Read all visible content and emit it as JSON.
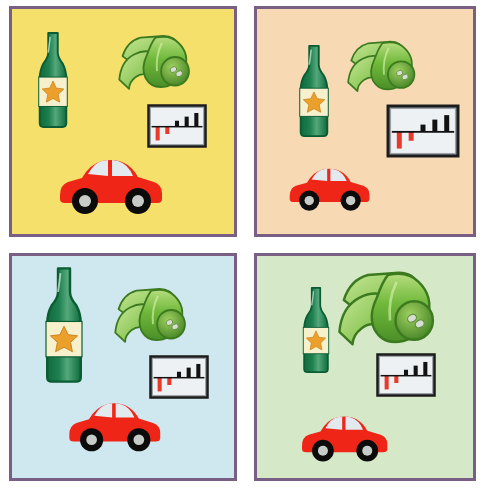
{
  "image": {
    "title": "Four clipart scenes grid",
    "layout": "2x2 grid of bordered panels",
    "border_color": "#7a5f85",
    "page_background": "#ffffff"
  },
  "panels": [
    {
      "id": "panel-top-left",
      "position": "top-left",
      "background_color": "#f5e06b",
      "objects": [
        {
          "name": "bottle-with-star-label",
          "label": "Bottle",
          "size": "medium",
          "x": 22,
          "y": 22,
          "w": 38,
          "h": 98
        },
        {
          "name": "rolled-carpet",
          "label": "Rolled carpet",
          "size": "medium",
          "x": 104,
          "y": 22,
          "w": 82,
          "h": 62
        },
        {
          "name": "bar-chart-picture",
          "label": "Bar chart picture",
          "size": "small",
          "x": 134,
          "y": 94,
          "w": 62,
          "h": 46
        },
        {
          "name": "red-car",
          "label": "Red car",
          "size": "large",
          "x": 42,
          "y": 136,
          "w": 110,
          "h": 72
        }
      ]
    },
    {
      "id": "panel-top-right",
      "position": "top-right",
      "background_color": "#f7d9b4",
      "objects": [
        {
          "name": "bottle-with-star-label",
          "label": "Bottle",
          "size": "medium",
          "x": 38,
          "y": 35,
          "w": 38,
          "h": 94
        },
        {
          "name": "rolled-carpet",
          "label": "Rolled carpet",
          "size": "medium",
          "x": 88,
          "y": 28,
          "w": 78,
          "h": 58
        },
        {
          "name": "bar-chart-picture",
          "label": "Bar chart picture",
          "size": "large",
          "x": 128,
          "y": 94,
          "w": 76,
          "h": 56
        },
        {
          "name": "red-car",
          "label": "Red car",
          "size": "small",
          "x": 28,
          "y": 148,
          "w": 86,
          "h": 56
        }
      ]
    },
    {
      "id": "panel-bottom-left",
      "position": "bottom-left",
      "background_color": "#cfe7ee",
      "objects": [
        {
          "name": "bottle-with-star-label",
          "label": "Bottle",
          "size": "large",
          "x": 28,
          "y": 10,
          "w": 48,
          "h": 118
        },
        {
          "name": "rolled-carpet",
          "label": "Rolled carpet",
          "size": "medium",
          "x": 100,
          "y": 28,
          "w": 82,
          "h": 62
        },
        {
          "name": "bar-chart-picture",
          "label": "Bar chart picture",
          "size": "small",
          "x": 136,
          "y": 98,
          "w": 62,
          "h": 46
        },
        {
          "name": "red-car",
          "label": "Red car",
          "size": "medium",
          "x": 52,
          "y": 134,
          "w": 98,
          "h": 64
        }
      ]
    },
    {
      "id": "panel-bottom-right",
      "position": "bottom-right",
      "background_color": "#d5e8c8",
      "objects": [
        {
          "name": "bottle-with-star-label",
          "label": "Bottle",
          "size": "small",
          "x": 42,
          "y": 30,
          "w": 34,
          "h": 88
        },
        {
          "name": "rolled-carpet",
          "label": "Rolled carpet",
          "size": "large",
          "x": 78,
          "y": 10,
          "w": 110,
          "h": 84
        },
        {
          "name": "bar-chart-picture",
          "label": "Bar chart picture",
          "size": "small",
          "x": 118,
          "y": 96,
          "w": 62,
          "h": 46
        },
        {
          "name": "red-car",
          "label": "Red car",
          "size": "medium",
          "x": 40,
          "y": 148,
          "w": 92,
          "h": 60
        }
      ]
    }
  ],
  "object_colors": {
    "bottle_glass": "#1f8050",
    "bottle_glass_dark": "#0f6b3d",
    "bottle_label": "#f7f0cc",
    "bottle_star": "#eba02c",
    "carpet_light": "#9ccd5a",
    "carpet_mid": "#6fb83a",
    "carpet_dark": "#4a8f28",
    "carpet_end_mark": "#d8ded3",
    "chart_frame": "#1c1c1c",
    "chart_paper": "#eef1f4",
    "chart_bar_up": "#121212",
    "chart_bar_down": "#e8392a",
    "car_body": "#ef2617",
    "car_window": "#e2eaf0",
    "car_tire": "#0b0b0b",
    "car_hub": "#c8ccc9"
  },
  "chart_data": {
    "type": "bar",
    "categories": [
      "1",
      "2",
      "3",
      "4",
      "5"
    ],
    "values": [
      -3.0,
      -1.6,
      1.3,
      2.2,
      3.0
    ],
    "xlabel": "",
    "ylabel": "",
    "ylim": [
      -3.5,
      3.5
    ],
    "grid": false,
    "legend": "none"
  }
}
